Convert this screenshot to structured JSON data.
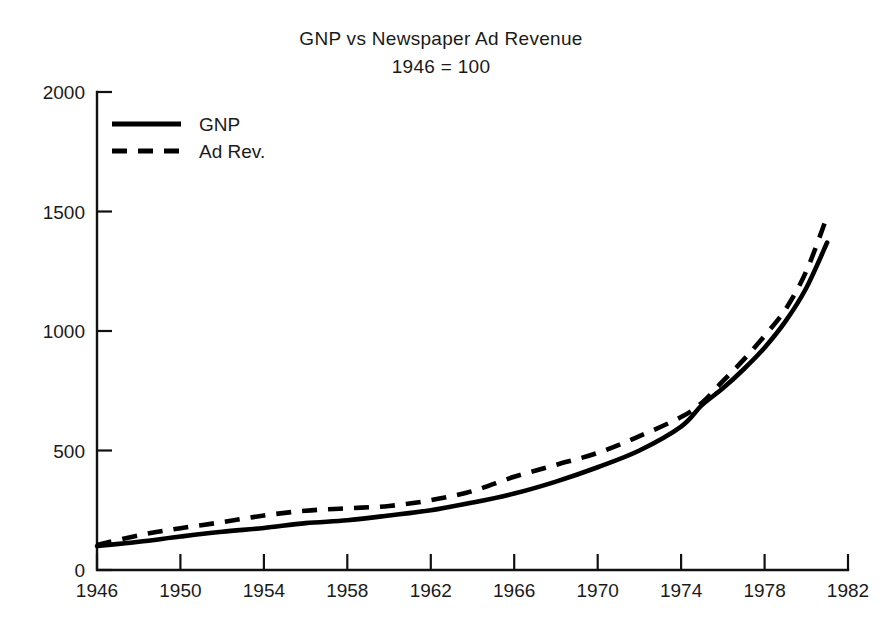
{
  "chart_data": {
    "type": "line",
    "title": "GNP vs Newspaper Ad Revenue",
    "subtitle": "1946 = 100",
    "xlabel": "",
    "ylabel": "",
    "xlim": [
      1946,
      1982
    ],
    "ylim": [
      0,
      2000
    ],
    "grid": false,
    "legend_position": "top-left",
    "xticks": [
      1946,
      1950,
      1954,
      1958,
      1962,
      1966,
      1970,
      1974,
      1978,
      1982
    ],
    "xtick_labels": [
      "1946",
      "1950",
      "1954",
      "1958",
      "1962",
      "1966",
      "1970",
      "1974",
      "1978",
      "1982"
    ],
    "yticks": [
      0,
      500,
      1000,
      1500,
      2000
    ],
    "ytick_labels": [
      "0",
      "500",
      "1000",
      "1500",
      "2000"
    ],
    "x": [
      1946,
      1948,
      1950,
      1952,
      1954,
      1956,
      1958,
      1960,
      1962,
      1964,
      1966,
      1968,
      1970,
      1972,
      1974,
      1975,
      1976,
      1977,
      1978,
      1979,
      1980,
      1981
    ],
    "series": [
      {
        "name": "GNP",
        "style": "solid",
        "color": "#000000",
        "values": [
          100,
          118,
          140,
          160,
          176,
          196,
          208,
          228,
          250,
          282,
          320,
          370,
          430,
          500,
          600,
          690,
          760,
          840,
          930,
          1040,
          1180,
          1370
        ]
      },
      {
        "name": "Ad Rev.",
        "style": "dashed",
        "color": "#000000",
        "values": [
          105,
          145,
          175,
          200,
          228,
          248,
          258,
          268,
          292,
          330,
          390,
          440,
          490,
          560,
          640,
          700,
          790,
          880,
          980,
          1090,
          1250,
          1480
        ]
      }
    ],
    "legend": [
      {
        "label": "GNP",
        "style": "solid"
      },
      {
        "label": "Ad Rev.",
        "style": "dashed"
      }
    ]
  },
  "axes": {
    "y_ticks": [
      {
        "label": "2000",
        "value": 2000
      },
      {
        "label": "1500",
        "value": 1500
      },
      {
        "label": "1000",
        "value": 1000
      },
      {
        "label": "500",
        "value": 500
      },
      {
        "label": "0",
        "value": 0
      }
    ],
    "x_ticks": [
      {
        "label": "1946",
        "value": 1946
      },
      {
        "label": "1950",
        "value": 1950
      },
      {
        "label": "1954",
        "value": 1954
      },
      {
        "label": "1958",
        "value": 1958
      },
      {
        "label": "1962",
        "value": 1962
      },
      {
        "label": "1966",
        "value": 1966
      },
      {
        "label": "1970",
        "value": 1970
      },
      {
        "label": "1974",
        "value": 1974
      },
      {
        "label": "1978",
        "value": 1978
      },
      {
        "label": "1982",
        "value": 1982
      }
    ]
  },
  "colors": {
    "background": "#ffffff",
    "ink": "#111111",
    "series": "#000000"
  }
}
